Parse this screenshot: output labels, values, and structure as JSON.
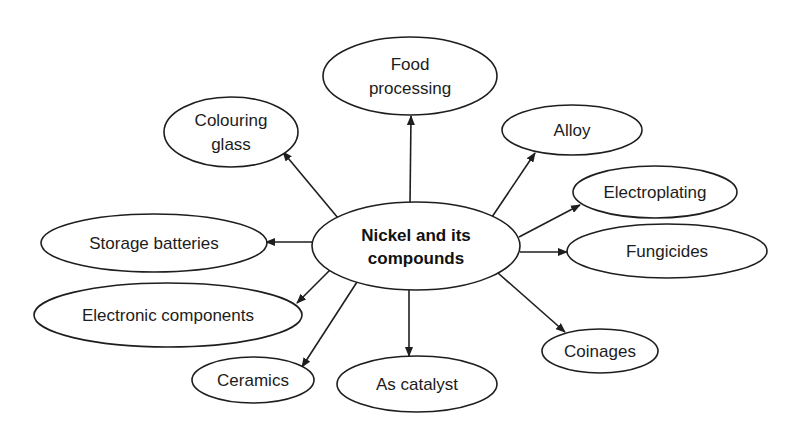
{
  "diagram": {
    "type": "radial-concept-map",
    "center": {
      "label_line1": "Nickel and its",
      "label_line2": "compounds",
      "cx": 416,
      "cy": 246,
      "rx": 104,
      "ry": 44
    },
    "nodes": [
      {
        "id": "food-processing",
        "line1": "Food",
        "line2": "processing",
        "cx": 410,
        "cy": 76,
        "rx": 87,
        "ry": 39,
        "edge": [
          410,
          204,
          411,
          116
        ]
      },
      {
        "id": "colouring-glass",
        "line1": "Colouring",
        "line2": "glass",
        "cx": 231,
        "cy": 132,
        "rx": 67,
        "ry": 35,
        "edge": [
          338,
          218,
          283,
          152
        ]
      },
      {
        "id": "alloy",
        "line1": "Alloy",
        "line2": "",
        "cx": 572,
        "cy": 130,
        "rx": 70,
        "ry": 25,
        "edge": [
          492,
          217,
          535,
          153
        ]
      },
      {
        "id": "electroplating",
        "line1": "Electroplating",
        "line2": "",
        "cx": 655,
        "cy": 192,
        "rx": 82,
        "ry": 26,
        "edge": [
          519,
          237,
          580,
          205
        ]
      },
      {
        "id": "fungicides",
        "line1": "Fungicides",
        "line2": "",
        "cx": 667,
        "cy": 251,
        "rx": 100,
        "ry": 27,
        "edge": [
          520,
          252,
          567,
          252
        ]
      },
      {
        "id": "coinages",
        "line1": "Coinages",
        "line2": "",
        "cx": 600,
        "cy": 351,
        "rx": 58,
        "ry": 22,
        "edge": [
          498,
          273,
          565,
          332
        ]
      },
      {
        "id": "as-catalyst",
        "line1": "As catalyst",
        "line2": "",
        "cx": 417,
        "cy": 384,
        "rx": 80,
        "ry": 28,
        "edge": [
          409,
          290,
          409,
          356
        ]
      },
      {
        "id": "ceramics",
        "line1": "Ceramics",
        "line2": "",
        "cx": 253,
        "cy": 380,
        "rx": 61,
        "ry": 23,
        "edge": [
          357,
          282,
          302,
          367
        ]
      },
      {
        "id": "electronic-components",
        "line1": "Electronic components",
        "line2": "",
        "cx": 168,
        "cy": 315,
        "rx": 134,
        "ry": 32,
        "edge": [
          330,
          270,
          297,
          303
        ]
      },
      {
        "id": "storage-batteries",
        "line1": "Storage batteries",
        "line2": "",
        "cx": 154,
        "cy": 243,
        "rx": 113,
        "ry": 29,
        "edge": [
          313,
          242,
          266,
          242
        ]
      }
    ],
    "colors": {
      "stroke": "#1e1e1e",
      "text": "#1c1c1c",
      "background": "#ffffff"
    }
  }
}
